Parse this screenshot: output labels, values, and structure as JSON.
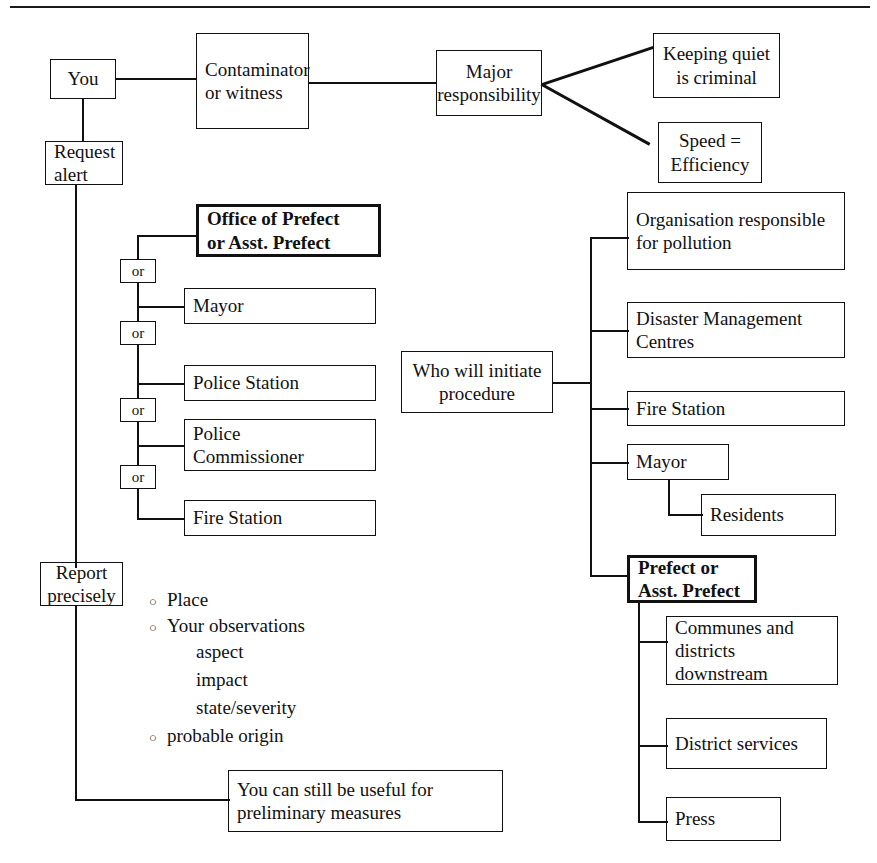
{
  "diagram": {
    "ink_color": "#111111",
    "background": "#ffffff"
  },
  "nodes": {
    "you": "You",
    "contaminator": "Contaminator\nor witness",
    "major_responsibility": "Major\nresponsibility",
    "keeping_quiet": "Keeping quiet\nis criminal",
    "speed_efficiency": "Speed =\nEfficiency",
    "request_alert": "Request\nalert",
    "office_of_prefect": "Office of Prefect\nor Asst. Prefect",
    "or_1": "or",
    "or_2": "or",
    "or_3": "or",
    "or_4": "or",
    "mayor_left": "Mayor",
    "police_station": "Police Station",
    "police_commissioner": "Police\nCommissioner",
    "fire_station_left": "Fire Station",
    "who_will_initiate": "Who will initiate\nprocedure",
    "organisation_responsible": "Organisation responsible\nfor pollution",
    "disaster_management": "Disaster Management\nCentres",
    "fire_station_right": "Fire Station",
    "mayor_right": "Mayor",
    "residents": "Residents",
    "prefect_or_asst": "Prefect or\nAsst. Prefect",
    "communes": "Communes and\ndistricts\ndownstream",
    "district_services": "District services",
    "press": "Press",
    "report_precisely": "Report\nprecisely",
    "still_useful": "You can still be useful for\npreliminary measures"
  },
  "report_details": {
    "bullet_glyph": "○",
    "items": [
      {
        "type": "bullet",
        "text": "Place"
      },
      {
        "type": "bullet",
        "text": "Your observations"
      },
      {
        "type": "sub",
        "text": "aspect"
      },
      {
        "type": "sub",
        "text": "impact"
      },
      {
        "type": "sub",
        "text": "state/severity"
      },
      {
        "type": "bullet",
        "text": "probable origin"
      }
    ]
  }
}
